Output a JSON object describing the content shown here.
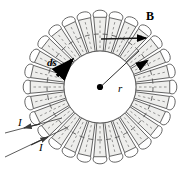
{
  "figure": {
    "kind": "physics-diagram",
    "width": 195,
    "height": 172,
    "background_color": "#ffffff"
  },
  "labels": {
    "magnetic_field": "B",
    "path_element": "ds",
    "radius": "r",
    "current_out": "I",
    "current_in": "I"
  },
  "icons": {
    "center_dot": "center-dot-icon",
    "field_arrow": "field-arrow-icon",
    "ds_arrow": "ds-arrow-icon",
    "loop_arrow": "loop-direction-arrow-icon",
    "current_arrow_out": "current-arrow-out-icon",
    "current_arrow_in": "current-arrow-in-icon"
  },
  "geometry": {
    "center_x": 100,
    "center_y": 87,
    "outer_radius": 78,
    "coil_outer_radius": 70,
    "coil_inner_radius": 36,
    "amperian_radius": 53,
    "turns": 28,
    "radius_line_angle_deg": -42,
    "field_arrow_y": 39,
    "field_arrow_x_start": 101,
    "field_arrow_x_end": 146
  },
  "colors": {
    "outline": "#4a4a4a",
    "coil_fill": "#eeeeec",
    "dashed_line": "#555555",
    "accent_black": "#000000",
    "lead_wire": "#555555"
  },
  "chart_data": {
    "type": "diagram",
    "annotations": [
      {
        "name": "B",
        "description": "magnetic field direction, tangent to Amperian circle, pointing right at top"
      },
      {
        "name": "ds",
        "description": "path element vector, tangent to Amperian circle, upper-left"
      },
      {
        "name": "r",
        "description": "radius of Amperian circle from toroid center"
      },
      {
        "name": "I",
        "description": "current entering the winding, lower lead wire"
      },
      {
        "name": "I",
        "description": "current leaving the winding, upper lead wire"
      }
    ]
  }
}
